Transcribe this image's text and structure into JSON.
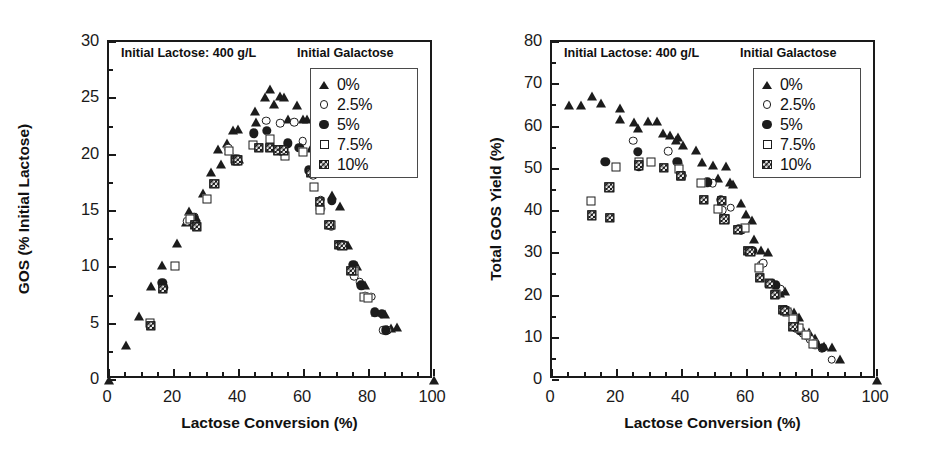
{
  "figure": {
    "panels": [
      "left",
      "right"
    ],
    "shared_xlabel": "Lactose Conversion (%)",
    "annotation": "Initial Lactose: 400 g/L",
    "legend_title": "Initial Galactose",
    "legend_entries": [
      {
        "label": "0%",
        "marker": "filled-triangle"
      },
      {
        "label": "2.5%",
        "marker": "open-circle"
      },
      {
        "label": "5%",
        "marker": "filled-circle"
      },
      {
        "label": "7.5%",
        "marker": "open-square"
      },
      {
        "label": "10%",
        "marker": "hatched-square"
      }
    ]
  },
  "chart_data": [
    {
      "panel": "left",
      "type": "scatter",
      "title": "",
      "annotation": "Initial Lactose: 400 g/L",
      "legend_title": "Initial Galactose",
      "legend_position": "top-right inside",
      "grid": false,
      "xlabel": "Lactose Conversion (%)",
      "ylabel": "GOS (% Initial Lactose)",
      "xlim": [
        0,
        100
      ],
      "ylim": [
        0,
        30
      ],
      "xticks": [
        0,
        20,
        40,
        60,
        80,
        100
      ],
      "yticks": [
        0,
        5,
        10,
        15,
        20,
        25,
        30
      ],
      "xminor_step": 5,
      "yminor_step": 2.5,
      "series": [
        {
          "name": "0%",
          "marker": "filled-triangle",
          "points": [
            [
              0,
              0
            ],
            [
              5.2,
              3.1
            ],
            [
              9.2,
              5.7
            ],
            [
              13.0,
              8.3
            ],
            [
              16.4,
              10.2
            ],
            [
              21.0,
              12.2
            ],
            [
              23.8,
              14.0
            ],
            [
              24.6,
              15.0
            ],
            [
              26.8,
              14.5
            ],
            [
              28.9,
              16.6
            ],
            [
              31.5,
              18.5
            ],
            [
              33.6,
              20.5
            ],
            [
              34.6,
              19.2
            ],
            [
              36.2,
              21.0
            ],
            [
              36.9,
              20.4
            ],
            [
              38.2,
              22.2
            ],
            [
              39.6,
              22.3
            ],
            [
              40.0,
              19.6
            ],
            [
              44.8,
              23.9
            ],
            [
              45.2,
              22.9
            ],
            [
              48.0,
              25.1
            ],
            [
              49.4,
              25.8
            ],
            [
              50.8,
              24.5
            ],
            [
              52.6,
              25.2
            ],
            [
              53.9,
              25.1
            ],
            [
              55.2,
              23.2
            ],
            [
              57.8,
              24.4
            ],
            [
              59.6,
              23.2
            ],
            [
              60.8,
              23.2
            ],
            [
              62.0,
              20.6
            ],
            [
              63.6,
              20.2
            ],
            [
              65.4,
              18.4
            ],
            [
              68.6,
              16.4
            ],
            [
              71.0,
              15.4
            ],
            [
              73.6,
              12.0
            ],
            [
              76.2,
              10.1
            ],
            [
              78.8,
              8.4
            ],
            [
              82.0,
              6.0
            ],
            [
              85.0,
              5.9
            ],
            [
              86.8,
              4.6
            ],
            [
              88.6,
              4.7
            ],
            [
              100,
              0
            ]
          ]
        },
        {
          "name": "2.5%",
          "marker": "open-circle",
          "points": [
            [
              24.1,
              14.1
            ],
            [
              26.2,
              14.5
            ],
            [
              36.6,
              20.6
            ],
            [
              39.2,
              19.6
            ],
            [
              48.4,
              23.0
            ],
            [
              52.6,
              22.8
            ],
            [
              57.0,
              22.9
            ],
            [
              59.6,
              21.2
            ],
            [
              62.8,
              18.2
            ],
            [
              65.2,
              16.0
            ],
            [
              68.4,
              13.6
            ],
            [
              72.0,
              12.0
            ],
            [
              75.4,
              9.2
            ],
            [
              77.2,
              8.7
            ],
            [
              78.8,
              7.5
            ],
            [
              80.6,
              7.4
            ],
            [
              84.4,
              4.4
            ],
            [
              85.6,
              4.4
            ]
          ]
        },
        {
          "name": "5%",
          "marker": "filled-circle",
          "points": [
            [
              16.4,
              8.6
            ],
            [
              16.8,
              8.2
            ],
            [
              26.0,
              14.4
            ],
            [
              26.6,
              13.9
            ],
            [
              39.0,
              19.6
            ],
            [
              44.6,
              21.9
            ],
            [
              48.6,
              22.1
            ],
            [
              55.0,
              21.0
            ],
            [
              58.6,
              20.6
            ],
            [
              61.4,
              18.6
            ],
            [
              65.0,
              15.2
            ],
            [
              68.6,
              15.9
            ],
            [
              71.8,
              12.0
            ],
            [
              75.2,
              10.2
            ],
            [
              77.6,
              8.4
            ],
            [
              81.8,
              6.0
            ],
            [
              84.0,
              5.9
            ],
            [
              85.2,
              4.4
            ]
          ]
        },
        {
          "name": "7.5%",
          "marker": "open-square",
          "points": [
            [
              12.6,
              5.1
            ],
            [
              20.2,
              10.1
            ],
            [
              25.0,
              14.3
            ],
            [
              30.2,
              16.1
            ],
            [
              36.8,
              20.3
            ],
            [
              38.8,
              19.6
            ],
            [
              44.2,
              20.9
            ],
            [
              49.4,
              21.4
            ],
            [
              52.2,
              20.4
            ],
            [
              54.2,
              19.9
            ],
            [
              59.8,
              20.2
            ],
            [
              63.2,
              17.1
            ],
            [
              64.8,
              15.1
            ],
            [
              68.2,
              13.8
            ],
            [
              71.4,
              12.0
            ],
            [
              75.4,
              9.7
            ],
            [
              78.4,
              7.4
            ],
            [
              79.8,
              7.3
            ]
          ]
        },
        {
          "name": "10%",
          "marker": "hatched-square",
          "points": [
            [
              12.8,
              4.8
            ],
            [
              16.6,
              8.1
            ],
            [
              26.4,
              13.8
            ],
            [
              27.0,
              13.6
            ],
            [
              32.4,
              17.4
            ],
            [
              39.0,
              19.5
            ],
            [
              39.6,
              19.5
            ],
            [
              46.0,
              20.6
            ],
            [
              49.4,
              20.6
            ],
            [
              52.0,
              20.4
            ],
            [
              53.8,
              20.4
            ],
            [
              62.0,
              18.4
            ],
            [
              64.8,
              15.8
            ],
            [
              67.8,
              13.8
            ],
            [
              70.8,
              12.0
            ],
            [
              71.8,
              11.9
            ],
            [
              74.6,
              9.7
            ]
          ]
        }
      ]
    },
    {
      "panel": "right",
      "type": "scatter",
      "title": "",
      "annotation": "Initial Lactose: 400 g/L",
      "legend_title": "Initial Galactose",
      "legend_position": "top-right inside",
      "grid": false,
      "xlabel": "Lactose Conversion (%)",
      "ylabel": "Total GOS Yield (%)",
      "xlim": [
        0,
        100
      ],
      "ylim": [
        0,
        80
      ],
      "xticks": [
        0,
        20,
        40,
        60,
        80,
        100
      ],
      "yticks": [
        0,
        10,
        20,
        30,
        40,
        50,
        60,
        70,
        80
      ],
      "xminor_step": 5,
      "yminor_step": 5,
      "series": [
        {
          "name": "0%",
          "marker": "filled-triangle",
          "points": [
            [
              5.2,
              65.0
            ],
            [
              9.0,
              65.0
            ],
            [
              12.4,
              67.2
            ],
            [
              15.0,
              65.6
            ],
            [
              20.8,
              61.8
            ],
            [
              21.0,
              64.4
            ],
            [
              25.2,
              61.0
            ],
            [
              26.4,
              59.6
            ],
            [
              29.4,
              61.2
            ],
            [
              32.4,
              61.2
            ],
            [
              34.0,
              58.4
            ],
            [
              36.2,
              58.0
            ],
            [
              38.0,
              56.8
            ],
            [
              38.8,
              57.6
            ],
            [
              40.2,
              55.6
            ],
            [
              44.2,
              54.4
            ],
            [
              46.0,
              51.6
            ],
            [
              49.4,
              50.8
            ],
            [
              51.0,
              47.8
            ],
            [
              53.4,
              50.6
            ],
            [
              54.8,
              46.8
            ],
            [
              55.8,
              46.4
            ],
            [
              58.0,
              41.8
            ],
            [
              59.6,
              39.4
            ],
            [
              61.6,
              37.8
            ],
            [
              62.0,
              33.4
            ],
            [
              64.4,
              30.8
            ],
            [
              66.4,
              30.4
            ],
            [
              68.2,
              23.0
            ],
            [
              70.2,
              20.6
            ],
            [
              71.8,
              21.0
            ],
            [
              74.4,
              16.0
            ],
            [
              76.0,
              15.0
            ],
            [
              79.0,
              11.4
            ],
            [
              81.0,
              10.0
            ],
            [
              83.8,
              8.0
            ],
            [
              86.0,
              7.8
            ],
            [
              88.6,
              5.0
            ],
            [
              100,
              0
            ]
          ]
        },
        {
          "name": "2.5%",
          "marker": "open-circle",
          "points": [
            [
              25.0,
              56.6
            ],
            [
              35.8,
              54.2
            ],
            [
              38.8,
              51.2
            ],
            [
              40.0,
              48.4
            ],
            [
              49.4,
              46.6
            ],
            [
              52.4,
              40.2
            ],
            [
              55.0,
              40.8
            ],
            [
              58.2,
              35.4
            ],
            [
              64.2,
              27.2
            ],
            [
              65.0,
              27.6
            ],
            [
              70.2,
              21.6
            ],
            [
              72.8,
              16.0
            ],
            [
              75.0,
              12.2
            ],
            [
              77.2,
              11.0
            ],
            [
              79.4,
              9.6
            ],
            [
              80.8,
              8.8
            ],
            [
              83.0,
              7.4
            ],
            [
              86.0,
              4.8
            ]
          ]
        },
        {
          "name": "5%",
          "marker": "filled-circle",
          "points": [
            [
              16.4,
              51.6
            ],
            [
              26.4,
              54.0
            ],
            [
              26.8,
              50.6
            ],
            [
              38.6,
              51.6
            ],
            [
              40.0,
              48.4
            ],
            [
              47.8,
              46.8
            ],
            [
              52.0,
              42.6
            ],
            [
              57.4,
              35.8
            ],
            [
              58.2,
              35.6
            ],
            [
              61.8,
              30.6
            ],
            [
              67.0,
              22.8
            ],
            [
              68.8,
              22.4
            ],
            [
              71.6,
              16.6
            ],
            [
              74.6,
              13.4
            ],
            [
              76.4,
              11.6
            ],
            [
              78.4,
              10.4
            ],
            [
              81.0,
              8.4
            ],
            [
              83.4,
              7.6
            ]
          ]
        },
        {
          "name": "7.5%",
          "marker": "open-square",
          "points": [
            [
              12.0,
              42.4
            ],
            [
              19.8,
              50.4
            ],
            [
              26.8,
              51.6
            ],
            [
              30.6,
              51.6
            ],
            [
              39.0,
              50.0
            ],
            [
              39.6,
              48.4
            ],
            [
              45.8,
              46.6
            ],
            [
              51.2,
              40.4
            ],
            [
              53.2,
              38.0
            ],
            [
              59.4,
              36.0
            ],
            [
              63.8,
              26.6
            ],
            [
              66.8,
              23.0
            ],
            [
              69.0,
              20.4
            ],
            [
              72.2,
              16.0
            ],
            [
              74.0,
              14.4
            ],
            [
              76.0,
              12.2
            ],
            [
              78.2,
              10.6
            ],
            [
              80.4,
              8.6
            ]
          ]
        },
        {
          "name": "10%",
          "marker": "hatched-square",
          "points": [
            [
              12.2,
              39.0
            ],
            [
              17.6,
              45.6
            ],
            [
              17.8,
              38.4
            ],
            [
              26.8,
              50.8
            ],
            [
              34.4,
              50.2
            ],
            [
              39.6,
              48.4
            ],
            [
              46.8,
              42.6
            ],
            [
              52.2,
              42.4
            ],
            [
              53.0,
              38.0
            ],
            [
              57.2,
              35.6
            ],
            [
              60.4,
              30.6
            ],
            [
              61.0,
              30.4
            ],
            [
              64.0,
              24.2
            ],
            [
              67.0,
              22.8
            ],
            [
              68.6,
              20.2
            ],
            [
              71.0,
              16.6
            ],
            [
              71.6,
              16.4
            ],
            [
              74.2,
              12.6
            ]
          ]
        }
      ]
    }
  ]
}
